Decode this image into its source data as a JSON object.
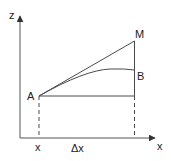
{
  "diagram": {
    "labels": {
      "z_axis": "z",
      "x_axis": "x",
      "point_a": "A",
      "point_m": "M",
      "point_b": "B",
      "x_tick": "x",
      "delta_x": "Δx"
    },
    "colors": {
      "line": "#4a4a4a",
      "text": "#222222"
    }
  }
}
